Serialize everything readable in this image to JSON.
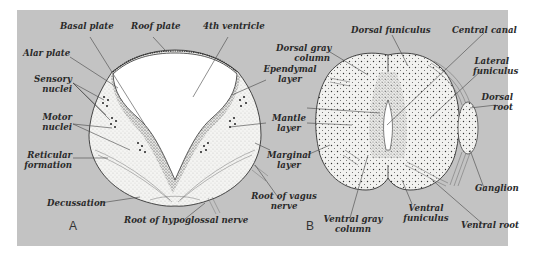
{
  "figure": {
    "background_color": "#c3c3c3",
    "tissue_color": "#f4f4f2",
    "cavity_color": "#ffffff",
    "ink_color": "#2a2a2a"
  },
  "panel_a": {
    "letter": "A",
    "title": "Medulla oblongata cross section",
    "labels": {
      "basal_plate": "Basal plate",
      "roof_plate": "Roof plate",
      "fourth_ventricle": "4th ventricle",
      "alar_plate": "Alar plate",
      "sensory_nuclei_1": "Sensory",
      "sensory_nuclei_2": "nuclei",
      "motor_nuclei_1": "Motor",
      "motor_nuclei_2": "nuclei",
      "reticular_formation_1": "Reticular",
      "reticular_formation_2": "formation",
      "decussation": "Decussation",
      "root_hypoglossal": "Root of hypoglossal nerve",
      "ependymal_layer_1": "Ependymal",
      "ependymal_layer_2": "layer",
      "mantle_layer_1": "Mantle",
      "mantle_layer_2": "layer",
      "marginal_layer_1": "Marginal",
      "marginal_layer_2": "layer",
      "root_vagus_1": "Root of vagus",
      "root_vagus_2": "nerve"
    }
  },
  "panel_b": {
    "letter": "B",
    "title": "Spinal cord cross section",
    "labels": {
      "dorsal_gray_column_1": "Dorsal gray",
      "dorsal_gray_column_2": "column",
      "dorsal_funiculus": "Dorsal funiculus",
      "central_canal": "Central canal",
      "lateral_funiculus_1": "Lateral",
      "lateral_funiculus_2": "funiculus",
      "dorsal_root_1": "Dorsal",
      "dorsal_root_2": "root",
      "ganglion": "Ganglion",
      "ventral_root": "Ventral root",
      "ventral_funiculus_1": "Ventral",
      "ventral_funiculus_2": "funiculus",
      "ventral_gray_column_1": "Ventral gray",
      "ventral_gray_column_2": "column"
    }
  }
}
